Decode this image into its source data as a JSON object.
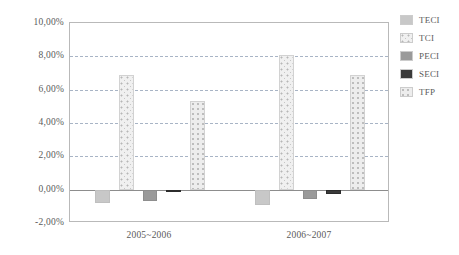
{
  "chart_data": {
    "type": "bar",
    "title": "",
    "xlabel": "",
    "ylabel": "",
    "grid": true,
    "legend_position": "right",
    "ylim": [
      -2.0,
      10.0
    ],
    "ytick_step": 2.0,
    "ytick_labels": [
      "10,00%",
      "8,00%",
      "6,00%",
      "4,00%",
      "2,00%",
      "0,00%",
      "-2,00%"
    ],
    "ytick_values": [
      10.0,
      8.0,
      6.0,
      4.0,
      2.0,
      0.0,
      -2.0
    ],
    "categories": [
      "2005~2006",
      "2006~2007"
    ],
    "series": [
      {
        "name": "TECI",
        "values": [
          -0.8,
          -0.9
        ],
        "color": "#c8c8c8",
        "pattern": "solid"
      },
      {
        "name": "TCI",
        "values": [
          6.9,
          8.1
        ],
        "color": "#f0f0f0",
        "pattern": "dotted"
      },
      {
        "name": "PECI",
        "values": [
          -0.7,
          -0.55
        ],
        "color": "#9a9a9a",
        "pattern": "solid"
      },
      {
        "name": "SECI",
        "values": [
          -0.15,
          -0.25
        ],
        "color": "#3a3a3a",
        "pattern": "solid"
      },
      {
        "name": "TFP",
        "values": [
          5.35,
          6.9
        ],
        "color": "#ededed",
        "pattern": "dotted"
      }
    ]
  },
  "legend": {
    "items": [
      {
        "label": "TECI"
      },
      {
        "label": "TCI"
      },
      {
        "label": "PECI"
      },
      {
        "label": "SECI"
      },
      {
        "label": "TFP"
      }
    ]
  },
  "axis": {
    "x_labels": [
      "2005~2006",
      "2006~2007"
    ]
  }
}
